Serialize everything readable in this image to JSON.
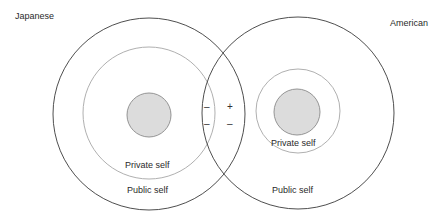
{
  "diagram": {
    "groups": [
      {
        "name": "Japanese",
        "label": "Japanese",
        "outer_label": "Public self",
        "inner_label": "Private self"
      },
      {
        "name": "American",
        "label": "American",
        "outer_label": "Public self",
        "inner_label": "Private self"
      }
    ],
    "overlap_signs": {
      "left_top": "–",
      "right_top": "+",
      "left_bottom": "–",
      "right_bottom": "–"
    },
    "colors": {
      "outer_stroke": "#3a3a3a",
      "middle_stroke": "#b0b0b0",
      "core_fill": "#d9d9d9",
      "core_stroke": "#8a8a8a"
    }
  }
}
